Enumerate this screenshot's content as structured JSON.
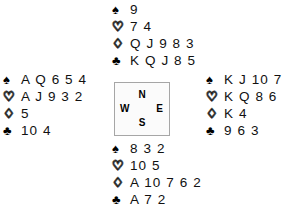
{
  "diagram": {
    "type": "bridge-deal-diagram",
    "suit_symbols": {
      "spades": "♠",
      "hearts": "♡",
      "diamonds": "♢",
      "clubs": "♣"
    },
    "compass": {
      "north": "N",
      "south": "S",
      "east": "E",
      "west": "W"
    },
    "hands": {
      "north": {
        "spades": "9",
        "hearts": "7 4",
        "diamonds": "Q J 9 8 3",
        "clubs": "K Q J 8 5"
      },
      "west": {
        "spades": "A Q 6 5 4",
        "hearts": "A J 9 3 2",
        "diamonds": "5",
        "clubs": "10 4"
      },
      "east": {
        "spades": "K J 10 7",
        "hearts": "K Q 8 6",
        "diamonds": "K 4",
        "clubs": "9 6 3"
      },
      "south": {
        "spades": "8 3 2",
        "hearts": "10 5",
        "diamonds": "A 10 7 6 2",
        "clubs": "A 7 2"
      }
    }
  }
}
